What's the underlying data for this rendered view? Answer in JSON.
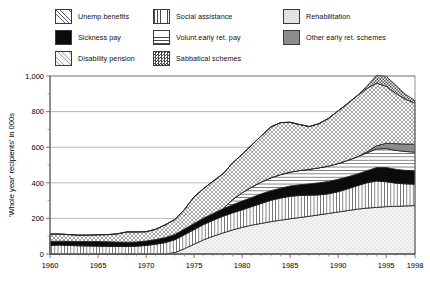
{
  "legend": {
    "columns": [
      {
        "items": [
          {
            "label": "Unemp.benefits",
            "key": "unemp",
            "pattern": "cross-hatch"
          },
          {
            "label": "Sickness pay",
            "key": "sickness",
            "pattern": "solid-black"
          },
          {
            "label": "Disability pension",
            "key": "disability",
            "pattern": "light-dots"
          }
        ]
      },
      {
        "items": [
          {
            "label": "Social assistance",
            "key": "social",
            "pattern": "vertical-lines"
          },
          {
            "label": "Volunt.early ret. pay",
            "key": "volunt",
            "pattern": "horizontal-lines"
          },
          {
            "label": "Sabbatical schemes",
            "key": "sabbatical",
            "pattern": "checkerboard"
          }
        ]
      },
      {
        "items": [
          {
            "label": "Rehabilitation",
            "key": "rehab",
            "pattern": "solid-light-gray"
          },
          {
            "label": "Other early ret. schemes",
            "key": "other",
            "pattern": "solid-gray"
          }
        ]
      }
    ]
  },
  "chart_data": {
    "type": "area",
    "stacked": true,
    "title": "",
    "xlabel": "",
    "ylabel": "'Whole year' recipients' in 000s",
    "xlim": [
      1960,
      1998
    ],
    "ylim": [
      0,
      1000
    ],
    "grid": true,
    "legend_position": "top",
    "ytick_labels": [
      "0",
      "200",
      "400",
      "600",
      "800",
      "1,000"
    ],
    "yticks": [
      0,
      200,
      400,
      600,
      800,
      1000
    ],
    "ytick_minor_step": 100,
    "xtick_labels": [
      "1960",
      "1965",
      "1970",
      "1975",
      "1980",
      "1985",
      "1990",
      "1995",
      "1998"
    ],
    "xticks": [
      1960,
      1965,
      1970,
      1975,
      1980,
      1985,
      1990,
      1995,
      1998
    ],
    "x": [
      1960,
      1961,
      1962,
      1963,
      1964,
      1965,
      1966,
      1967,
      1968,
      1969,
      1970,
      1971,
      1972,
      1973,
      1974,
      1975,
      1976,
      1977,
      1978,
      1979,
      1980,
      1981,
      1982,
      1983,
      1984,
      1985,
      1986,
      1987,
      1988,
      1989,
      1990,
      1991,
      1992,
      1993,
      1994,
      1995,
      1996,
      1997,
      1998
    ],
    "series": [
      {
        "name": "Disability pension",
        "key": "disability",
        "pattern": "light-dots",
        "values": [
          0,
          0,
          0,
          0,
          0,
          0,
          0,
          0,
          0,
          0,
          0,
          0,
          0,
          8,
          30,
          55,
          80,
          100,
          118,
          135,
          150,
          162,
          172,
          182,
          190,
          198,
          205,
          212,
          220,
          228,
          236,
          244,
          252,
          258,
          262,
          266,
          268,
          270,
          272
        ]
      },
      {
        "name": "Social assistance",
        "key": "social",
        "pattern": "vertical-lines",
        "values": [
          48,
          50,
          48,
          46,
          45,
          44,
          43,
          42,
          42,
          44,
          48,
          55,
          64,
          72,
          78,
          82,
          86,
          90,
          94,
          96,
          98,
          104,
          112,
          120,
          124,
          126,
          124,
          118,
          112,
          110,
          114,
          122,
          132,
          142,
          148,
          140,
          130,
          124,
          120
        ]
      },
      {
        "name": "Sickness pay",
        "key": "sickness",
        "pattern": "solid-black",
        "values": [
          22,
          22,
          23,
          24,
          25,
          26,
          26,
          25,
          24,
          24,
          25,
          26,
          28,
          30,
          32,
          34,
          36,
          38,
          42,
          46,
          50,
          52,
          54,
          54,
          56,
          58,
          60,
          64,
          68,
          70,
          70,
          68,
          66,
          68,
          76,
          80,
          78,
          76,
          75
        ]
      },
      {
        "name": "Volunt.early ret. pay",
        "key": "volunt",
        "pattern": "horizontal-lines",
        "values": [
          0,
          0,
          0,
          0,
          0,
          0,
          0,
          0,
          0,
          0,
          0,
          0,
          0,
          0,
          0,
          0,
          0,
          0,
          0,
          28,
          46,
          58,
          66,
          72,
          76,
          78,
          80,
          82,
          84,
          86,
          88,
          92,
          96,
          100,
          104,
          106,
          106,
          106,
          105
        ]
      },
      {
        "name": "Rehabilitation",
        "key": "rehab",
        "pattern": "solid-light-gray",
        "values": [
          0,
          0,
          0,
          0,
          0,
          0,
          0,
          0,
          0,
          0,
          0,
          0,
          0,
          0,
          0,
          0,
          0,
          0,
          0,
          0,
          0,
          0,
          0,
          0,
          0,
          0,
          0,
          0,
          0,
          0,
          0,
          0,
          0,
          0,
          0,
          0,
          0,
          0,
          0
        ]
      },
      {
        "name": "Other early ret. schemes",
        "key": "other",
        "pattern": "solid-gray",
        "values": [
          0,
          0,
          0,
          0,
          0,
          0,
          0,
          0,
          0,
          0,
          0,
          0,
          0,
          0,
          0,
          0,
          0,
          0,
          0,
          0,
          0,
          0,
          0,
          0,
          0,
          0,
          0,
          0,
          0,
          0,
          0,
          0,
          0,
          6,
          18,
          30,
          38,
          42,
          45
        ]
      },
      {
        "name": "Unemp.benefits",
        "key": "unemp",
        "pattern": "cross-hatch",
        "values": [
          42,
          40,
          38,
          36,
          36,
          38,
          40,
          46,
          58,
          56,
          52,
          58,
          72,
          84,
          110,
          150,
          166,
          182,
          196,
          206,
          216,
          236,
          260,
          286,
          292,
          280,
          258,
          240,
          248,
          268,
          296,
          320,
          344,
          356,
          352,
          320,
          282,
          252,
          230
        ]
      },
      {
        "name": "Sabbatical schemes",
        "key": "sabbatical",
        "pattern": "checkerboard",
        "values": [
          0,
          0,
          0,
          0,
          0,
          0,
          0,
          0,
          0,
          0,
          0,
          0,
          0,
          0,
          0,
          0,
          0,
          0,
          0,
          0,
          0,
          0,
          0,
          0,
          0,
          0,
          0,
          0,
          0,
          0,
          0,
          0,
          0,
          14,
          44,
          56,
          46,
          28,
          15
        ]
      }
    ]
  }
}
